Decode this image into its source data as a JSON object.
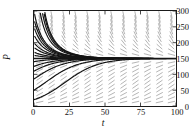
{
  "chart_data": {
    "type": "line",
    "title": "",
    "xlabel": "t",
    "ylabel": "P",
    "xlim": [
      0,
      100
    ],
    "ylim": [
      0,
      300
    ],
    "xticks": [
      0,
      25,
      50,
      75,
      100
    ],
    "yticks": [
      0,
      50,
      100,
      150,
      200,
      250,
      300
    ],
    "grid": false,
    "legend": "none",
    "equilibrium": 150,
    "field": {
      "style": "dash-segments",
      "color": "#9a9a9a",
      "x_step": 6.25,
      "y_step": 25,
      "note": "Segments slope downward where P > 150 and upward where P < 150; slope magnitude decreases toward P = 150."
    },
    "series": [
      {
        "name": "equilibrium",
        "P0": 150,
        "color": "#141414",
        "width": 1.7
      },
      {
        "name": "solution-1",
        "P0": 300,
        "color": "#141414",
        "width": 1.2
      },
      {
        "name": "solution-2",
        "P0": 275,
        "color": "#141414",
        "width": 1.2
      },
      {
        "name": "solution-3",
        "P0": 250,
        "color": "#141414",
        "width": 1.2
      },
      {
        "name": "solution-4",
        "P0": 225,
        "color": "#141414",
        "width": 1.2
      },
      {
        "name": "solution-5",
        "P0": 200,
        "color": "#141414",
        "width": 1.2
      },
      {
        "name": "solution-6",
        "P0": 185,
        "color": "#141414",
        "width": 1.2
      },
      {
        "name": "solution-7",
        "P0": 170,
        "color": "#141414",
        "width": 1.2
      },
      {
        "name": "solution-8",
        "P0": 160,
        "color": "#141414",
        "width": 1.2
      },
      {
        "name": "solution-9",
        "P0": 140,
        "color": "#141414",
        "width": 1.2
      },
      {
        "name": "solution-10",
        "P0": 125,
        "color": "#141414",
        "width": 1.2
      },
      {
        "name": "solution-11",
        "P0": 110,
        "color": "#141414",
        "width": 1.2
      },
      {
        "name": "solution-12",
        "P0": 85,
        "color": "#141414",
        "width": 1.2
      },
      {
        "name": "solution-13",
        "P0": 50,
        "color": "#141414",
        "width": 1.2
      },
      {
        "name": "solution-14",
        "P0": 20,
        "color": "#141414",
        "width": 1.2
      }
    ]
  },
  "axes": {
    "x_tick_labels": [
      "0",
      "25",
      "50",
      "75",
      "100"
    ],
    "y_tick_labels": [
      "300",
      "250",
      "200",
      "150",
      "100",
      "50",
      "0"
    ],
    "x_title": "t",
    "y_title": "P",
    "frame_color": "#1a1a1a"
  }
}
